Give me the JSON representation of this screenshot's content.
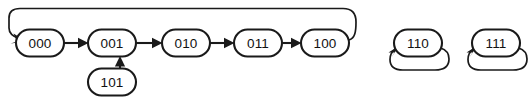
{
  "diagram": {
    "kind": "state-transition-diagram",
    "title": "",
    "background_color": "#ffffff",
    "line_color": "#1a1a1a",
    "label_color": "#111111",
    "nodes": [
      {
        "id": "n000",
        "label": "000",
        "cx": 40,
        "cy": 43,
        "rx": 24,
        "ry": 13.5
      },
      {
        "id": "n001",
        "label": "001",
        "cx": 112,
        "cy": 43,
        "rx": 24,
        "ry": 13.5
      },
      {
        "id": "n010",
        "label": "010",
        "cx": 186,
        "cy": 43,
        "rx": 24,
        "ry": 13.5
      },
      {
        "id": "n011",
        "label": "011",
        "cx": 258,
        "cy": 43,
        "rx": 24,
        "ry": 13.5
      },
      {
        "id": "n100",
        "label": "100",
        "cx": 325,
        "cy": 43,
        "rx": 24,
        "ry": 13.5
      },
      {
        "id": "n101",
        "label": "101",
        "cx": 112,
        "cy": 82,
        "rx": 24,
        "ry": 13.5
      },
      {
        "id": "n110",
        "label": "110",
        "cx": 418,
        "cy": 43,
        "rx": 24,
        "ry": 13.5
      },
      {
        "id": "n111",
        "label": "111",
        "cx": 496,
        "cy": 43,
        "rx": 24,
        "ry": 13.5
      }
    ],
    "edges": [
      {
        "id": "e000-001",
        "from": "000",
        "to": "001",
        "type": "straight-horizontal"
      },
      {
        "id": "e001-010",
        "from": "001",
        "to": "010",
        "type": "straight-horizontal"
      },
      {
        "id": "e010-011",
        "from": "010",
        "to": "011",
        "type": "straight-horizontal"
      },
      {
        "id": "e011-100",
        "from": "011",
        "to": "100",
        "type": "straight-horizontal"
      },
      {
        "id": "e101-001",
        "from": "101",
        "to": "001",
        "type": "straight-vertical"
      },
      {
        "id": "e100-000",
        "from": "100",
        "to": "000",
        "type": "feedback-arc-over-top"
      },
      {
        "id": "e110-110",
        "from": "110",
        "to": "110",
        "type": "self-loop"
      },
      {
        "id": "e111-111",
        "from": "111",
        "to": "111",
        "type": "self-loop"
      }
    ]
  }
}
